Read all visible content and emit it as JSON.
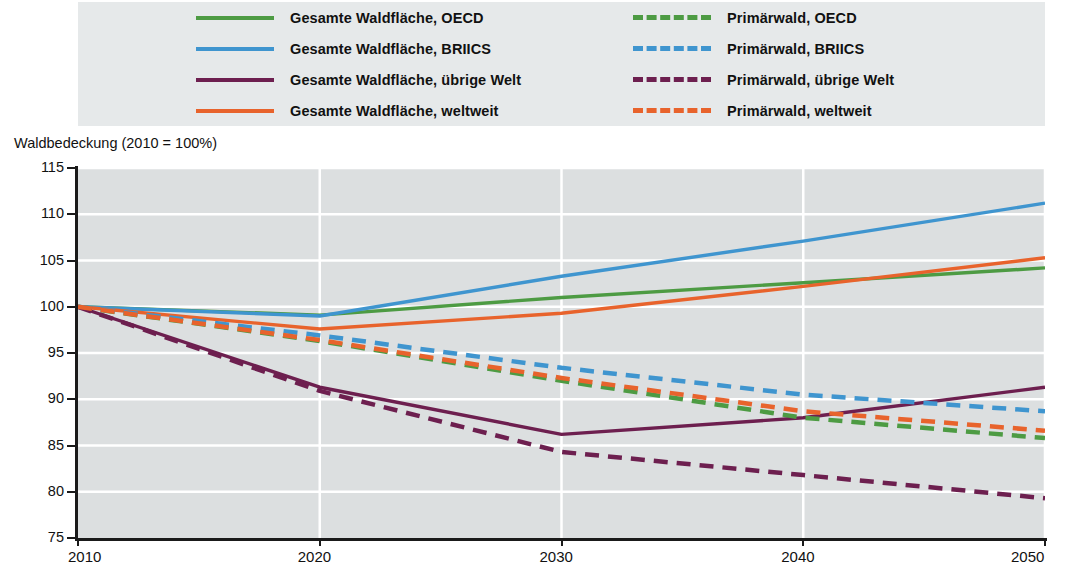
{
  "legend": {
    "items": [
      {
        "label": "Gesamte Waldfläche, OECD",
        "color": "#4d9b43",
        "style": "solid",
        "column": "a"
      },
      {
        "label": "Gesamte Waldfläche, BRIICS",
        "color": "#3f95cf",
        "style": "solid",
        "column": "a"
      },
      {
        "label": "Gesamte Waldfläche, übrige Welt",
        "color": "#6d1f4f",
        "style": "solid",
        "column": "a"
      },
      {
        "label": "Gesamte Waldfläche, weltweit",
        "color": "#e8632c",
        "style": "solid",
        "column": "a"
      },
      {
        "label": "Primärwald, OECD",
        "color": "#4d9b43",
        "style": "dashed",
        "column": "b"
      },
      {
        "label": "Primärwald, BRIICS",
        "color": "#3f95cf",
        "style": "dashed",
        "column": "b"
      },
      {
        "label": "Primärwald, übrige Welt",
        "color": "#6d1f4f",
        "style": "dashed",
        "column": "b"
      },
      {
        "label": "Primärwald, weltweit",
        "color": "#e8632c",
        "style": "dashed",
        "column": "b"
      }
    ]
  },
  "axis_title": "Waldbedeckung (2010 = 100%)",
  "chart_data": {
    "type": "line",
    "title": "",
    "subtitle": "",
    "xlabel": "",
    "ylabel": "Waldbedeckung (2010 = 100%)",
    "x": [
      2010,
      2020,
      2030,
      2040,
      2050
    ],
    "xlim": [
      2010,
      2050
    ],
    "ylim": [
      75,
      115
    ],
    "xticks": [
      2010,
      2020,
      2030,
      2040,
      2050
    ],
    "yticks": [
      75,
      80,
      85,
      90,
      95,
      100,
      105,
      110,
      115
    ],
    "grid": "horizontal",
    "legend_position": "top",
    "plot_background": "#dcdfe0",
    "gridline_color": "#ffffff",
    "series": [
      {
        "name": "Gesamte Waldfläche, OECD",
        "color": "#4d9b43",
        "style": "solid",
        "values": [
          100.0,
          99.1,
          101.0,
          102.6,
          104.2
        ]
      },
      {
        "name": "Gesamte Waldfläche, BRIICS",
        "color": "#3f95cf",
        "style": "solid",
        "values": [
          100.0,
          99.0,
          103.3,
          107.1,
          111.2
        ]
      },
      {
        "name": "Gesamte Waldfläche, übrige Welt",
        "color": "#6d1f4f",
        "style": "solid",
        "values": [
          100.0,
          91.3,
          86.2,
          88.0,
          91.3
        ]
      },
      {
        "name": "Gesamte Waldfläche, weltweit",
        "color": "#e8632c",
        "style": "solid",
        "values": [
          100.0,
          97.6,
          99.3,
          102.2,
          105.3
        ]
      },
      {
        "name": "Primärwald, OECD",
        "color": "#4d9b43",
        "style": "dashed",
        "values": [
          100.0,
          96.3,
          92.0,
          88.0,
          85.8
        ]
      },
      {
        "name": "Primärwald, BRIICS",
        "color": "#3f95cf",
        "style": "dashed",
        "values": [
          100.0,
          96.9,
          93.4,
          90.5,
          88.7
        ]
      },
      {
        "name": "Primärwald, übrige Welt",
        "color": "#6d1f4f",
        "style": "dashed",
        "values": [
          100.0,
          90.9,
          84.3,
          81.8,
          79.3
        ]
      },
      {
        "name": "Primärwald, weltweit",
        "color": "#e8632c",
        "style": "dashed",
        "values": [
          100.0,
          96.4,
          92.3,
          88.7,
          86.6
        ]
      }
    ]
  }
}
